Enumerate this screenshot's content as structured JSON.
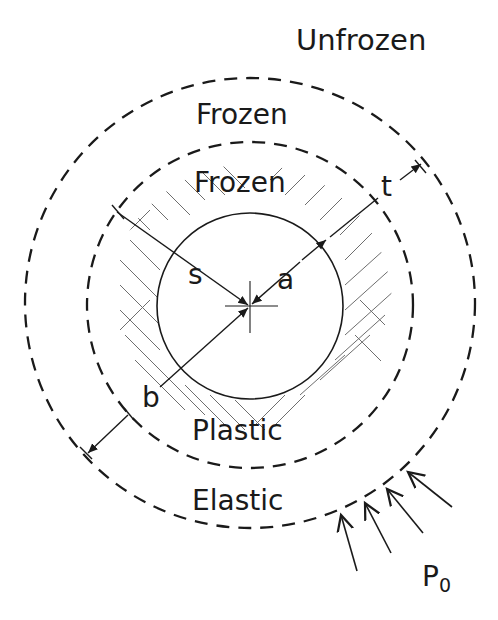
{
  "diagram": {
    "regions": {
      "unfrozen": "Unfrozen",
      "frozen_outer": "Frozen",
      "frozen_inner": "Frozen",
      "plastic": "Plastic",
      "elastic": "Elastic"
    },
    "dimensions": {
      "s": "s",
      "a": "a",
      "t": "t",
      "b": "b"
    },
    "load": {
      "label": "P",
      "subscript": "0"
    },
    "colors": {
      "line": "#1a1a1a",
      "hatch": "#555555",
      "background": "#ffffff"
    }
  }
}
